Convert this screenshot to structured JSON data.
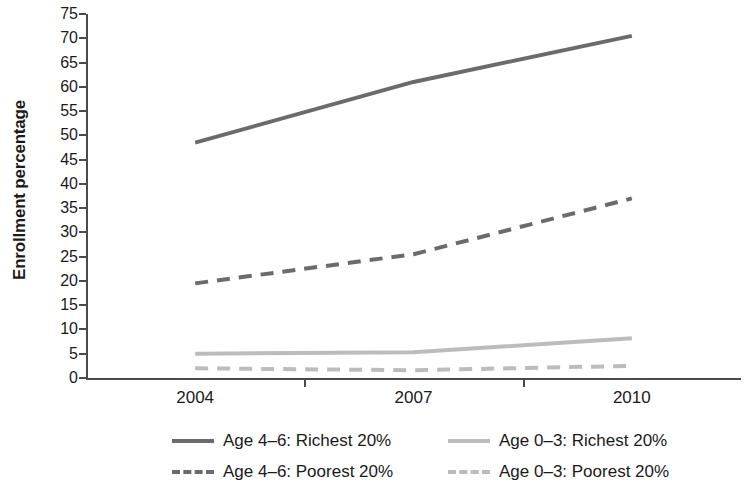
{
  "chart_data": {
    "type": "line",
    "title": "",
    "subtitle": "",
    "xlabel": "",
    "ylabel": "Enrollment percentage",
    "x": [
      "2004",
      "2007",
      "2010"
    ],
    "categories": [
      "2004",
      "2007",
      "2010"
    ],
    "xtick_labels": [
      "2004",
      "2007",
      "2010"
    ],
    "ytick_labels": [
      "0",
      "5",
      "10",
      "15",
      "20",
      "25",
      "30",
      "35",
      "40",
      "45",
      "50",
      "55",
      "60",
      "65",
      "70",
      "75"
    ],
    "ytick_values": [
      0,
      5,
      10,
      15,
      20,
      25,
      30,
      35,
      40,
      45,
      50,
      55,
      60,
      65,
      70,
      75
    ],
    "ylim": [
      0,
      75
    ],
    "grid": false,
    "legend_position": "bottom",
    "series": [
      {
        "name": "Age 4–6: Richest 20%",
        "values": [
          48.5,
          61.0,
          70.5
        ],
        "color": "#6b6b6b",
        "style": "solid",
        "swatch": "sw-solid-dark"
      },
      {
        "name": "Age 4–6: Poorest 20%",
        "values": [
          19.5,
          25.5,
          37.0
        ],
        "color": "#6b6b6b",
        "style": "dashed",
        "swatch": "sw-dash-dark"
      },
      {
        "name": "Age 0–3: Richest 20%",
        "values": [
          5.0,
          5.3,
          8.2
        ],
        "color": "#bcbcbc",
        "style": "solid",
        "swatch": "sw-solid-light"
      },
      {
        "name": "Age 0–3: Poorest 20%",
        "values": [
          2.0,
          1.6,
          2.5
        ],
        "color": "#bcbcbc",
        "style": "dashed",
        "swatch": "sw-dash-light"
      }
    ],
    "legend": [
      {
        "label": "Age 4–6: Richest 20%",
        "swatch": "sw-solid-dark",
        "row": 0,
        "col": 0
      },
      {
        "label": "Age 0–3: Richest 20%",
        "swatch": "sw-solid-light",
        "row": 0,
        "col": 1
      },
      {
        "label": "Age 4–6: Poorest 20%",
        "swatch": "sw-dash-dark",
        "row": 1,
        "col": 0
      },
      {
        "label": "Age 0–3: Poorest 20%",
        "swatch": "sw-dash-light",
        "row": 1,
        "col": 1
      }
    ],
    "colors": {
      "dark_series": "#6b6b6b",
      "light_series": "#bcbcbc",
      "axis": "#4a4a4a",
      "text": "#1a1a1a",
      "background": "#ffffff"
    }
  }
}
